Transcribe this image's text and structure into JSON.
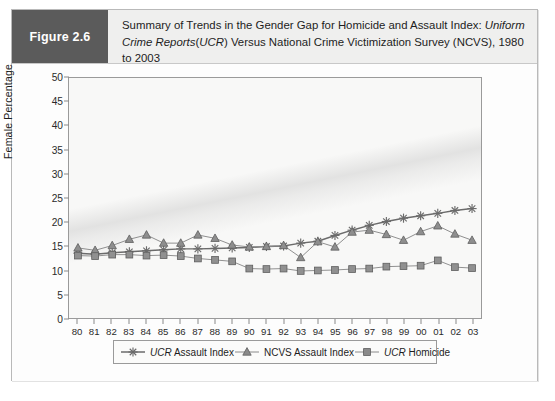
{
  "figure": {
    "tag": "Figure 2.6",
    "title_line1_plain": "Summary of Trends in the Gender Gap for Homicide and Assault Index: ",
    "title_line1_italic": "Uniform Crime",
    "title_line2_italic": "Reports",
    "title_line2_paren_italic": "UCR",
    "title_line2_plain": ") Versus National Crime Victimization Survey (NCVS), 1980 to 2003",
    "title_full": "Summary of Trends in the Gender Gap for Homicide and Assault Index: Uniform Crime Reports (UCR) Versus National Crime Victimization Survey (NCVS), 1980 to 2003"
  },
  "legend": {
    "items": [
      {
        "label_italic": "UCR",
        "label_plain": " Assault Index",
        "marker": "asterisk-marker",
        "color": "#6b6b6b"
      },
      {
        "label_italic": "",
        "label_plain": "NCVS Assault Index",
        "marker": "triangle-marker",
        "color": "#8a8a8a"
      },
      {
        "label_italic": "UCR",
        "label_plain": " Homicide",
        "marker": "square-marker",
        "color": "#8a8a8a"
      }
    ]
  },
  "colors": {
    "tag_background": "#5b5b5b",
    "header_background": "#efefee",
    "plot_background": "#f8f8f7",
    "axis": "#9a9a9a",
    "ucr_assault": "#6b6b6b",
    "ncvs_assault": "#8e8e8e",
    "ucr_homicide": "#909090"
  },
  "chart_data": {
    "type": "line",
    "xlabel": "",
    "ylabel": "Female Percentage",
    "ylim": [
      0,
      50
    ],
    "ytick_step": 5,
    "yticks": [
      0,
      5,
      10,
      15,
      20,
      25,
      30,
      35,
      40,
      45,
      50
    ],
    "grid": false,
    "legend_position": "bottom",
    "categories": [
      "80",
      "81",
      "82",
      "83",
      "84",
      "85",
      "86",
      "87",
      "88",
      "89",
      "90",
      "91",
      "92",
      "93",
      "94",
      "95",
      "96",
      "97",
      "98",
      "99",
      "00",
      "01",
      "02",
      "03"
    ],
    "series": [
      {
        "name": "UCR Assault Index",
        "marker": "asterisk",
        "values": [
          13.5,
          13.3,
          13.6,
          13.8,
          14.0,
          14.2,
          14.4,
          14.4,
          14.5,
          14.6,
          14.7,
          14.9,
          15.0,
          15.6,
          16.0,
          17.2,
          18.3,
          19.3,
          20.1,
          20.8,
          21.3,
          21.8,
          22.4,
          22.8
        ]
      },
      {
        "name": "NCVS Assault Index",
        "marker": "triangle",
        "values": [
          14.6,
          14.1,
          15.1,
          16.4,
          17.3,
          15.6,
          15.6,
          17.3,
          16.6,
          15.2,
          14.8,
          14.9,
          15.1,
          12.6,
          15.9,
          14.8,
          17.9,
          18.3,
          17.4,
          16.2,
          18.0,
          19.2,
          17.5,
          16.2
        ]
      },
      {
        "name": "UCR Homicide",
        "marker": "square",
        "values": [
          13.0,
          12.9,
          13.2,
          13.2,
          13.0,
          13.1,
          12.9,
          12.4,
          12.1,
          11.8,
          10.3,
          10.2,
          10.3,
          9.8,
          9.9,
          10.0,
          10.2,
          10.3,
          10.7,
          10.8,
          10.9,
          12.0,
          10.6,
          10.4
        ]
      }
    ]
  }
}
